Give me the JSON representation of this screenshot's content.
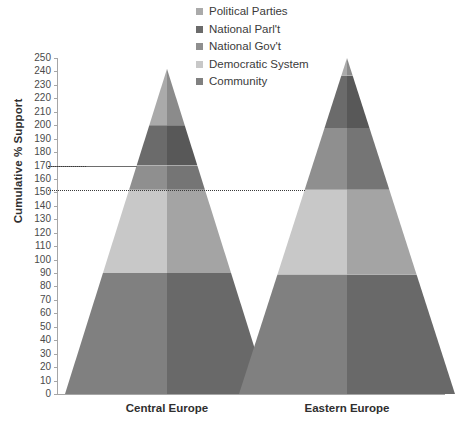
{
  "chart_data": {
    "type": "bar",
    "title": "",
    "subtype": "3d-stacked-pyramid",
    "xlabel": "",
    "ylabel": "Cumulative % Support",
    "ylim": [
      0,
      250
    ],
    "ytick_step": 10,
    "grid": false,
    "legend_position": "top-center",
    "categories": [
      "Central Europe",
      "Eastern Europe"
    ],
    "ytick_labels": [
      "0",
      "10",
      "20",
      "30",
      "40",
      "50",
      "60",
      "70",
      "80",
      "90",
      "100",
      "110",
      "120",
      "130",
      "140",
      "150",
      "160",
      "170",
      "180",
      "190",
      "200",
      "210",
      "220",
      "230",
      "240",
      "250"
    ],
    "series": [
      {
        "name": "Community",
        "color": "#808080",
        "values": [
          90,
          89
        ],
        "cumulative_top": [
          90,
          89
        ]
      },
      {
        "name": "Democratic System",
        "color": "#c8c8c8",
        "values": [
          62,
          63
        ],
        "cumulative_top": [
          152,
          152
        ]
      },
      {
        "name": "National Gov't",
        "color": "#8f8f8f",
        "values": [
          18,
          46
        ],
        "cumulative_top": [
          170,
          198
        ]
      },
      {
        "name": "National Parl't",
        "color": "#6b6b6b",
        "values": [
          30,
          39
        ],
        "cumulative_top": [
          200,
          237
        ]
      },
      {
        "name": "Political Parties",
        "color": "#aaaaaa",
        "values": [
          42,
          13
        ],
        "cumulative_top": [
          242,
          250
        ]
      }
    ],
    "legend_entries": [
      {
        "label": "Political Parties",
        "color": "#aaaaaa"
      },
      {
        "label": "National Parl't",
        "color": "#6b6b6b"
      },
      {
        "label": "National Gov't",
        "color": "#8f8f8f"
      },
      {
        "label": "Democratic System",
        "color": "#c8c8c8"
      },
      {
        "label": "Community",
        "color": "#808080"
      }
    ],
    "annotations": [
      {
        "name": "leader-line-170",
        "value": 170,
        "style": "solid",
        "extends_to": "Central Europe"
      },
      {
        "name": "leader-line-152",
        "value": 152,
        "style": "dotted",
        "extends_to": "Eastern Europe"
      }
    ]
  }
}
